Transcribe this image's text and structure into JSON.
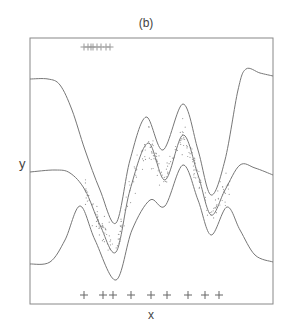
{
  "chart_data": {
    "type": "line",
    "title": "(b)",
    "xlabel": "x",
    "ylabel": "y",
    "grid": false,
    "legend": null,
    "series": [
      {
        "name": "upper band",
        "points_px": [
          [
            30,
            79
          ],
          [
            48,
            79
          ],
          [
            60,
            85
          ],
          [
            72,
            110
          ],
          [
            85,
            150
          ],
          [
            100,
            190
          ],
          [
            116,
            223
          ],
          [
            130,
            160
          ],
          [
            146,
            117
          ],
          [
            163,
            150
          ],
          [
            183,
            104
          ],
          [
            198,
            150
          ],
          [
            211,
            195
          ],
          [
            225,
            160
          ],
          [
            238,
            90
          ],
          [
            246,
            69
          ],
          [
            260,
            73
          ],
          [
            273,
            76
          ]
        ]
      },
      {
        "name": "mean",
        "points_px": [
          [
            30,
            172
          ],
          [
            55,
            170
          ],
          [
            70,
            173
          ],
          [
            85,
            190
          ],
          [
            100,
            225
          ],
          [
            116,
            252
          ],
          [
            130,
            190
          ],
          [
            148,
            143
          ],
          [
            165,
            180
          ],
          [
            183,
            135
          ],
          [
            198,
            175
          ],
          [
            211,
            215
          ],
          [
            225,
            190
          ],
          [
            240,
            165
          ],
          [
            255,
            168
          ],
          [
            273,
            175
          ]
        ]
      },
      {
        "name": "lower band",
        "points_px": [
          [
            30,
            264
          ],
          [
            50,
            262
          ],
          [
            65,
            240
          ],
          [
            80,
            206
          ],
          [
            95,
            240
          ],
          [
            116,
            280
          ],
          [
            132,
            230
          ],
          [
            150,
            200
          ],
          [
            165,
            206
          ],
          [
            183,
            165
          ],
          [
            198,
            200
          ],
          [
            211,
            235
          ],
          [
            227,
            207
          ],
          [
            240,
            230
          ],
          [
            255,
            255
          ],
          [
            273,
            262
          ]
        ]
      }
    ],
    "inducing_points_bottom_px_x": [
      84,
      103,
      113,
      131,
      151,
      167,
      188,
      205,
      219
    ],
    "inducing_points_top_px_x": [
      84,
      88,
      91,
      93,
      97,
      101,
      106,
      110
    ],
    "plot_frame_px": {
      "left": 30,
      "top": 38,
      "right": 273,
      "bottom": 304
    }
  }
}
